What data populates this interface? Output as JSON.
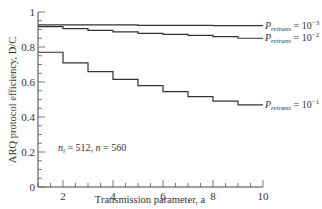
{
  "chart_data": {
    "type": "line",
    "step": true,
    "xlabel": "Transmission parameter, a",
    "ylabel": "ARQ protocol efficiency, D/C",
    "xlim": [
      1,
      10
    ],
    "ylim": [
      0,
      1
    ],
    "xticks": [
      2,
      4,
      6,
      8,
      10
    ],
    "yticks": [
      0,
      0.2,
      0.4,
      0.6,
      0.8,
      1
    ],
    "annotation": "n_i = 512, n = 560",
    "series": [
      {
        "name": "P_retrans = 10^-3",
        "label_main": "P",
        "label_sub": "retrans",
        "label_val": " = 10",
        "label_exp": "−3",
        "x": [
          1,
          2,
          3,
          4,
          5,
          6,
          7,
          8,
          9,
          10
        ],
        "values": [
          0.927,
          0.927,
          0.927,
          0.927,
          0.924,
          0.924,
          0.924,
          0.922,
          0.922,
          0.922
        ]
      },
      {
        "name": "P_retrans = 10^-2",
        "label_main": "P",
        "label_sub": "retrans",
        "label_val": " = 10",
        "label_exp": "−2",
        "x": [
          1,
          2,
          3,
          4,
          5,
          6,
          7,
          8,
          9,
          10
        ],
        "values": [
          0.916,
          0.905,
          0.895,
          0.886,
          0.878,
          0.872,
          0.867,
          0.859,
          0.85,
          0.85
        ]
      },
      {
        "name": "P_retrans = 10^-1",
        "label_main": "P",
        "label_sub": "retrans",
        "label_val": " = 10",
        "label_exp": "−1",
        "x": [
          1,
          2,
          3,
          4,
          5,
          6,
          7,
          8,
          9,
          10
        ],
        "values": [
          0.77,
          0.709,
          0.659,
          0.615,
          0.579,
          0.545,
          0.516,
          0.491,
          0.469,
          0.469
        ]
      }
    ]
  }
}
